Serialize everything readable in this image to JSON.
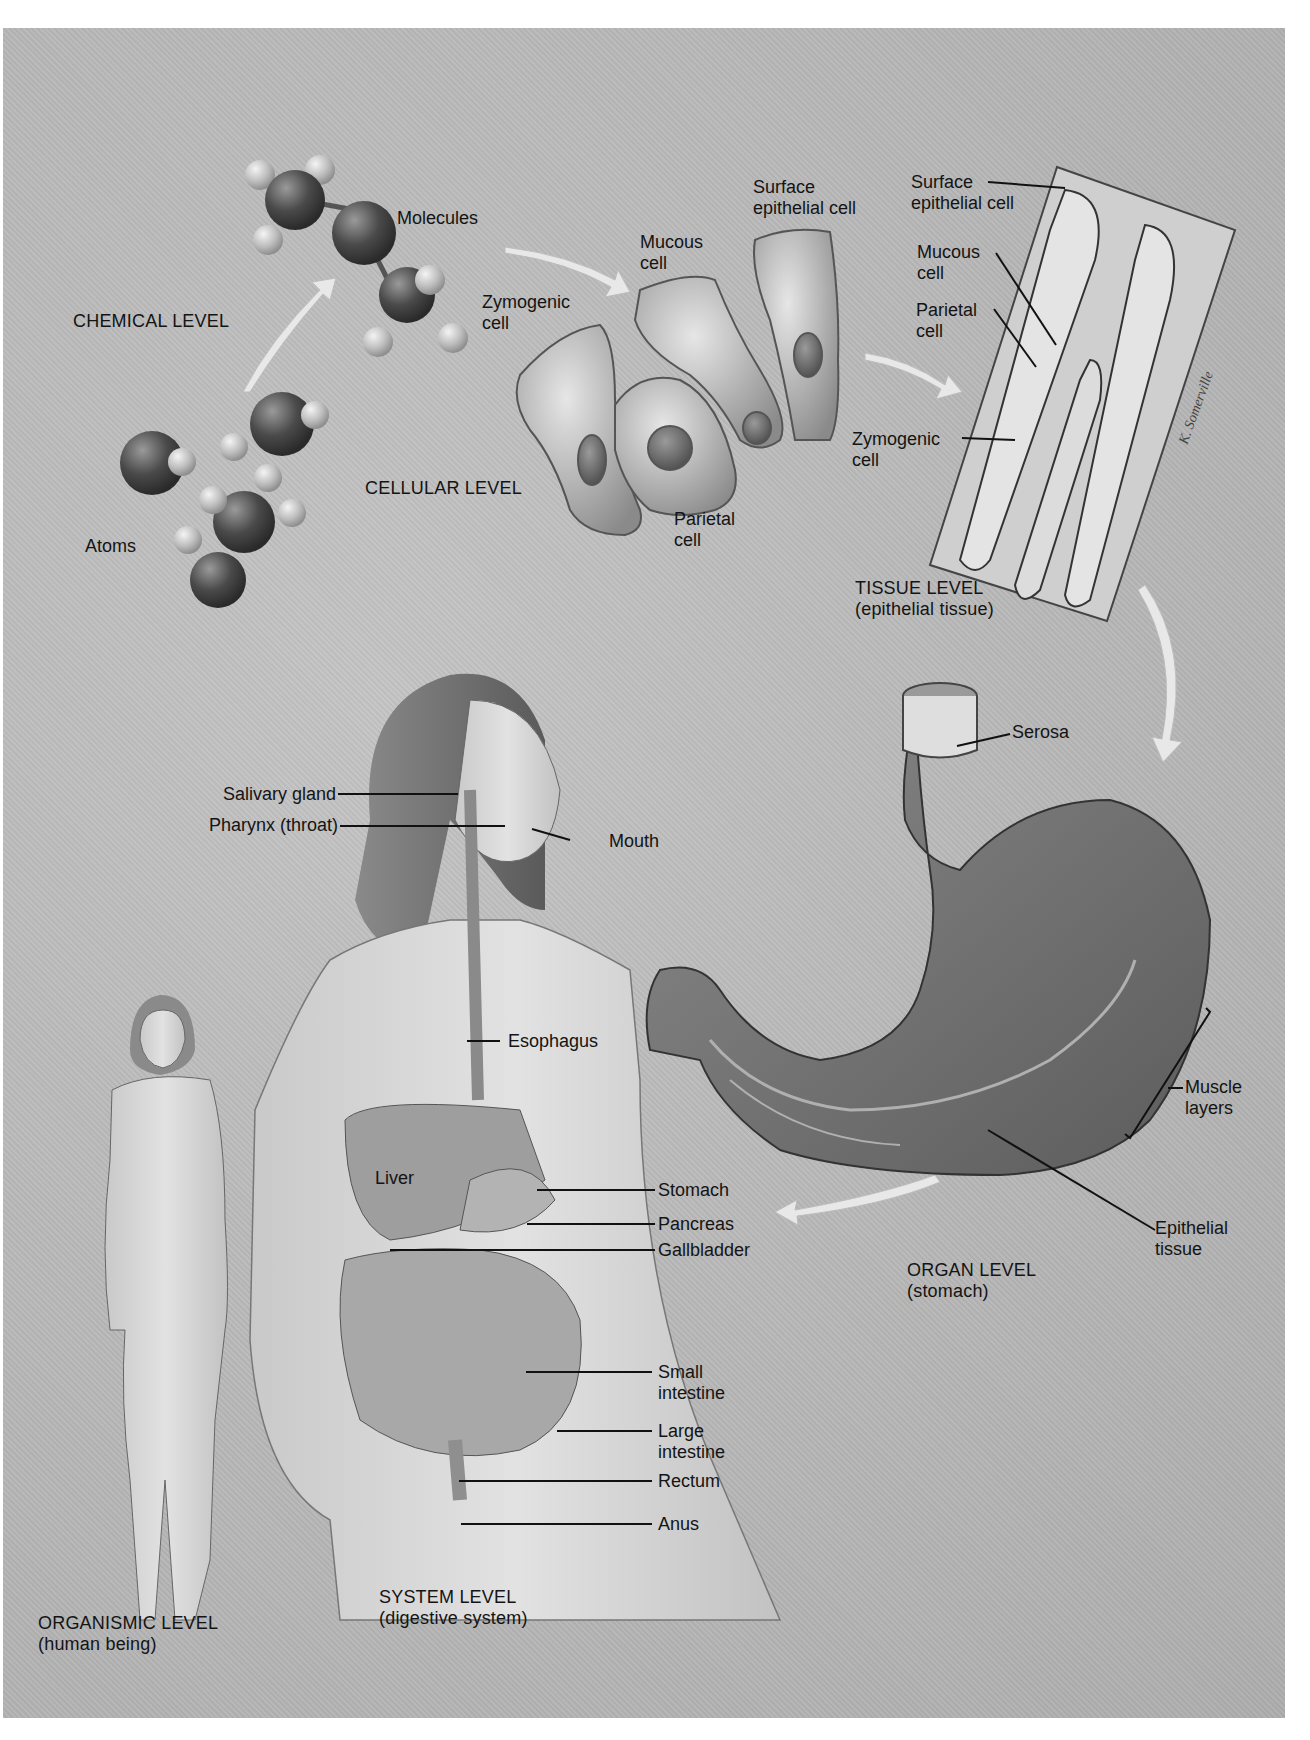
{
  "figure": {
    "background_color": "#b8b8b8",
    "ink_color": "#141414",
    "levels": [
      {
        "id": "chemical",
        "label": "CHEMICAL LEVEL"
      },
      {
        "id": "cellular",
        "label": "CELLULAR LEVEL"
      },
      {
        "id": "tissue",
        "label": "TISSUE LEVEL",
        "sub": "(epithelial tissue)"
      },
      {
        "id": "organ",
        "label": "ORGAN LEVEL",
        "sub": "(stomach)"
      },
      {
        "id": "system",
        "label": "SYSTEM LEVEL",
        "sub": "(digestive system)"
      },
      {
        "id": "organismic",
        "label": "ORGANISMIC LEVEL",
        "sub": "(human being)"
      }
    ],
    "chemical": {
      "atoms_label": "Atoms",
      "molecules_label": "Molecules"
    },
    "cellular": {
      "zymogenic": [
        "Zymogenic",
        "cell"
      ],
      "mucous": [
        "Mucous",
        "cell"
      ],
      "surface": [
        "Surface",
        "epithelial cell"
      ],
      "parietal": [
        "Parietal",
        "cell"
      ]
    },
    "tissue": {
      "surface": [
        "Surface",
        "epithelial cell"
      ],
      "mucous": [
        "Mucous",
        "cell"
      ],
      "parietal": [
        "Parietal",
        "cell"
      ],
      "zymogenic": [
        "Zymogenic",
        "cell"
      ],
      "signature": "K. Somerville"
    },
    "organ": {
      "serosa": "Serosa",
      "muscle": [
        "Muscle",
        "layers"
      ],
      "epithelial": [
        "Epithelial",
        "tissue"
      ]
    },
    "system": {
      "salivary": "Salivary gland",
      "pharynx": "Pharynx (throat)",
      "mouth": "Mouth",
      "esophagus": "Esophagus",
      "liver": "Liver",
      "stomach": "Stomach",
      "pancreas": "Pancreas",
      "gallbladder": "Gallbladder",
      "small_intestine": [
        "Small",
        "intestine"
      ],
      "large_intestine": [
        "Large",
        "intestine"
      ],
      "rectum": "Rectum",
      "anus": "Anus"
    }
  }
}
